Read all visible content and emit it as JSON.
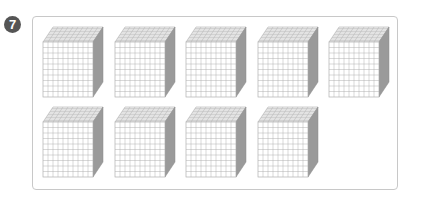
{
  "problem": {
    "number": "7",
    "badge_color": "#555555"
  },
  "figure": {
    "block_type": "thousand-cube",
    "grid_divisions": 10,
    "rows": [
      {
        "count": 5
      },
      {
        "count": 4
      }
    ],
    "total_cubes": 9,
    "colors": {
      "frame_border": "#c8c8c8",
      "grid_line": "#b0b0b0",
      "front_face": "#ffffff",
      "top_face": "#f4f4f4",
      "side_face": "#9a9a9a"
    }
  }
}
